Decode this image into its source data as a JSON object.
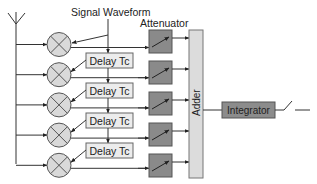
{
  "diagram": {
    "labels": {
      "signal_waveform": "Signal Waveform",
      "attenuator": "Attenuator",
      "adder": "Adder",
      "integrator": "Integrator"
    },
    "delays": [
      {
        "label": "Delay Tc"
      },
      {
        "label": "Delay Tc"
      },
      {
        "label": "Delay Tc"
      },
      {
        "label": "Delay Tc"
      }
    ],
    "branch_count": 5,
    "colors": {
      "multiplier_fill": "#d9d9d9",
      "delay_fill": "#ececec",
      "attenuator_fill": "#8a8a8a",
      "adder_fill": "#dcdcdc",
      "integrator_fill": "#8c8c8c",
      "line": "#333333"
    }
  }
}
